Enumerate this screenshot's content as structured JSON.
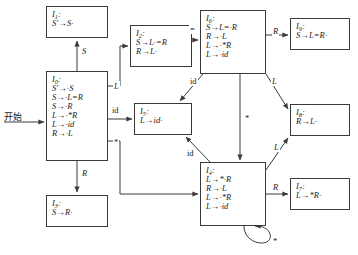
{
  "diagram": {
    "start_label": "开始",
    "stroke": "#3a3a3a",
    "text_color": "#1b1b1b",
    "background": "#ffffff"
  },
  "states": [
    {
      "id": "I1",
      "name": "I",
      "index": "1",
      "label": "I1:",
      "items": [
        "S′→S·"
      ],
      "x": 46,
      "y": 6,
      "w": 62,
      "h": 32
    },
    {
      "id": "I0",
      "name": "I",
      "index": "0",
      "label": "I0:",
      "items": [
        "S′→·S",
        "S→·L=R",
        "S→·R",
        "L→·*R",
        "L→·id",
        "R→·L"
      ],
      "x": 46,
      "y": 71,
      "w": 62,
      "h": 90
    },
    {
      "id": "I3",
      "name": "I",
      "index": "3",
      "label": "I3:",
      "items": [
        "S→R·"
      ],
      "x": 46,
      "y": 195,
      "w": 62,
      "h": 32
    },
    {
      "id": "I2",
      "name": "I",
      "index": "2",
      "label": "I2:",
      "items": [
        "S→L·=R",
        "R→L·"
      ],
      "x": 130,
      "y": 25,
      "w": 62,
      "h": 42
    },
    {
      "id": "I5",
      "name": "I",
      "index": "5",
      "label": "I5:",
      "items": [
        "L→id·"
      ],
      "x": 134,
      "y": 103,
      "w": 58,
      "h": 32
    },
    {
      "id": "I6",
      "name": "I",
      "index": "6",
      "label": "I6:",
      "items": [
        "S→L=·R",
        "R→·L",
        "L→·*R",
        "L→·id"
      ],
      "x": 200,
      "y": 10,
      "w": 66,
      "h": 64
    },
    {
      "id": "I4",
      "name": "I",
      "index": "4",
      "label": "I4:",
      "items": [
        "L→*·R",
        "R→·L",
        "L→·*R",
        "L→·id"
      ],
      "x": 200,
      "y": 162,
      "w": 66,
      "h": 64
    },
    {
      "id": "I9",
      "name": "I",
      "index": "9",
      "label": "I9:",
      "items": [
        "S→L=R·"
      ],
      "x": 290,
      "y": 18,
      "w": 60,
      "h": 32
    },
    {
      "id": "I8",
      "name": "I",
      "index": "8",
      "label": "I8:",
      "items": [
        "R→L·"
      ],
      "x": 290,
      "y": 104,
      "w": 60,
      "h": 32
    },
    {
      "id": "I7",
      "name": "I",
      "index": "7",
      "label": "I7:",
      "items": [
        "L→*R·"
      ],
      "x": 290,
      "y": 178,
      "w": 60,
      "h": 32
    }
  ],
  "edges": [
    {
      "from": "start",
      "to": "I0",
      "symbol": ""
    },
    {
      "from": "I0",
      "to": "I1",
      "symbol": "S"
    },
    {
      "from": "I0",
      "to": "I2",
      "symbol": "L"
    },
    {
      "from": "I0",
      "to": "I3",
      "symbol": "R"
    },
    {
      "from": "I0",
      "to": "I5",
      "symbol": "id"
    },
    {
      "from": "I0",
      "to": "I4",
      "symbol": "*"
    },
    {
      "from": "I2",
      "to": "I6",
      "symbol": "="
    },
    {
      "from": "I6",
      "to": "I9",
      "symbol": "R"
    },
    {
      "from": "I6",
      "to": "I8",
      "symbol": "L"
    },
    {
      "from": "I6",
      "to": "I5",
      "symbol": "id"
    },
    {
      "from": "I6",
      "to": "I4",
      "symbol": "*"
    },
    {
      "from": "I4",
      "to": "I7",
      "symbol": "R"
    },
    {
      "from": "I4",
      "to": "I8",
      "symbol": "L"
    },
    {
      "from": "I4",
      "to": "I5",
      "symbol": "id"
    },
    {
      "from": "I4",
      "to": "I4",
      "symbol": "*"
    }
  ],
  "edge_labels": [
    {
      "key": "start",
      "text": "开始",
      "x": 4,
      "y": 110
    },
    {
      "key": "s_to_i1",
      "text": "S",
      "x": 81,
      "y": 49
    },
    {
      "key": "l_to_i2",
      "text": "L",
      "x": 113,
      "y": 86
    },
    {
      "key": "id_to_i5",
      "text": "id",
      "x": 112,
      "y": 110
    },
    {
      "key": "r_to_i3",
      "text": "R",
      "x": 81,
      "y": 172
    },
    {
      "key": "star_to_i4",
      "text": "*",
      "x": 114,
      "y": 141
    },
    {
      "key": "eq_to_i6",
      "text": "=",
      "x": 190,
      "y": 27
    },
    {
      "key": "r_to_i9",
      "text": "R",
      "x": 273,
      "y": 30
    },
    {
      "key": "l_to_i8_from_i6",
      "text": "L",
      "x": 272,
      "y": 80
    },
    {
      "key": "id_to_i5_from_i6",
      "text": "id",
      "x": 191,
      "y": 80
    },
    {
      "key": "star_to_i4_from_i6",
      "text": "*",
      "x": 245,
      "y": 117
    },
    {
      "key": "id_to_i5_from_i4",
      "text": "id",
      "x": 188,
      "y": 152
    },
    {
      "key": "l_to_i8_from_i4",
      "text": "L",
      "x": 274,
      "y": 146
    },
    {
      "key": "r_to_i7",
      "text": "R",
      "x": 273,
      "y": 186
    },
    {
      "key": "star_self_i4",
      "text": "*",
      "x": 258,
      "y": 240
    }
  ]
}
